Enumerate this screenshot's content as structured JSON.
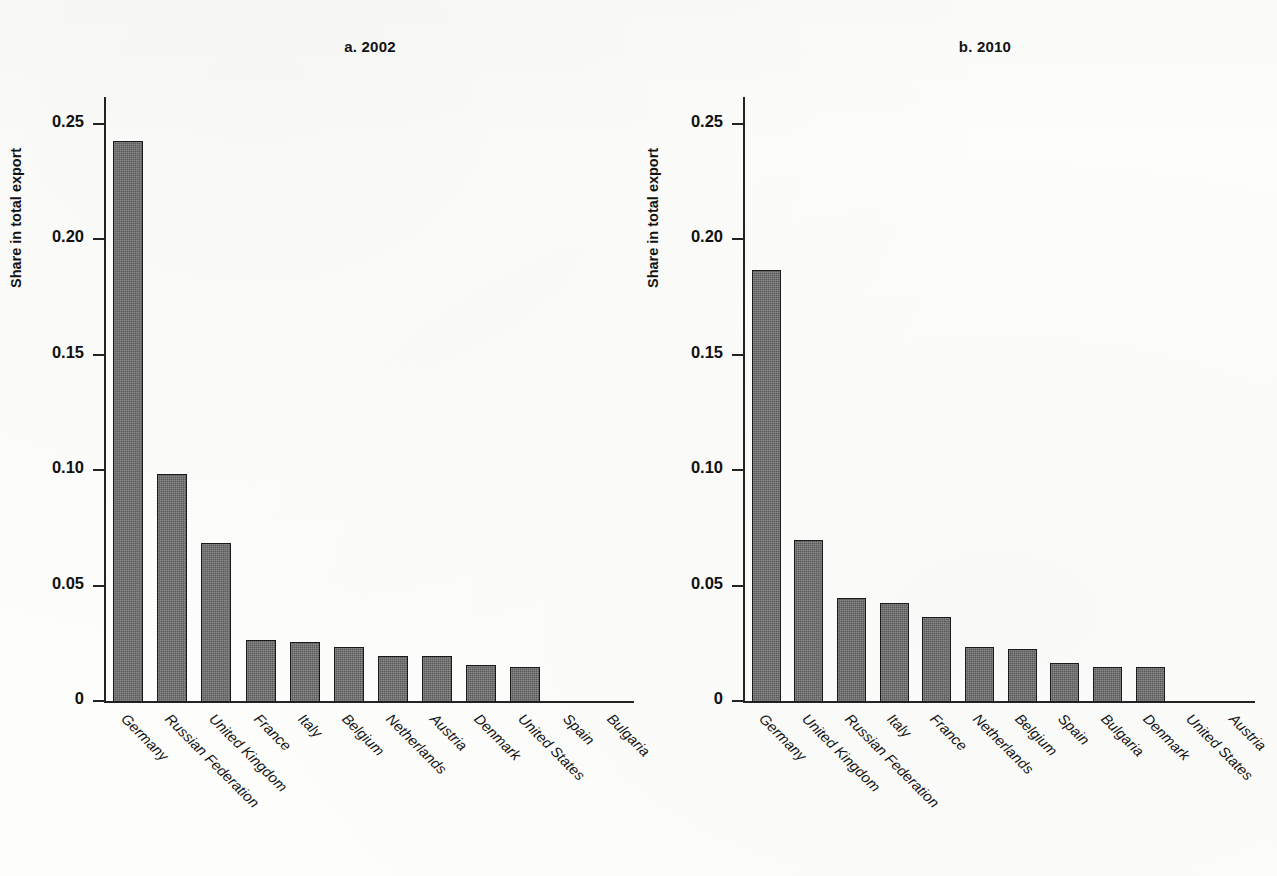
{
  "figure": {
    "ylabel": "Share in total export",
    "bar_color": "#5b5b5b",
    "bar_border_color": "#1a1a1a",
    "axis_color": "#232323"
  },
  "panels": [
    {
      "title": "a. 2002",
      "ylabel": "Share in total export"
    },
    {
      "title": "b. 2010",
      "ylabel": "Share in total export"
    }
  ],
  "axis": {
    "tick_labels": [
      "0.25",
      "0.20",
      "0.15",
      "0.10",
      "0.05",
      "0"
    ],
    "tick_values": [
      0.25,
      0.2,
      0.15,
      0.1,
      0.05,
      0
    ]
  },
  "chart_data": [
    {
      "type": "bar",
      "title": "a. 2002",
      "xlabel": "",
      "ylabel": "Share in total export",
      "ylim": [
        0,
        0.26
      ],
      "yticks": [
        0,
        0.05,
        0.1,
        0.15,
        0.2,
        0.25
      ],
      "ytick_labels": [
        "0",
        "0.05",
        "0.10",
        "0.15",
        "0.20",
        "0.25"
      ],
      "grid": false,
      "legend": "none",
      "categories": [
        "Germany",
        "Russian Federation",
        "United Kingdom",
        "France",
        "Italy",
        "Belgium",
        "Netherlands",
        "Austria",
        "Denmark",
        "United States",
        "Spain",
        "Bulgaria"
      ],
      "values": [
        0.243,
        0.099,
        0.069,
        0.027,
        0.026,
        0.024,
        0.02,
        0.02,
        0.016,
        0.015,
        0.0,
        0.0
      ]
    },
    {
      "type": "bar",
      "title": "b. 2010",
      "xlabel": "",
      "ylabel": "Share in total export",
      "ylim": [
        0,
        0.26
      ],
      "yticks": [
        0,
        0.05,
        0.1,
        0.15,
        0.2,
        0.25
      ],
      "ytick_labels": [
        "0",
        "0.05",
        "0.10",
        "0.15",
        "0.20",
        "0.25"
      ],
      "grid": false,
      "legend": "none",
      "categories": [
        "Germany",
        "United Kingdom",
        "Russian Federation",
        "Italy",
        "France",
        "Netherlands",
        "Belgium",
        "Spain",
        "Bulgaria",
        "Denmark",
        "United States",
        "Austria"
      ],
      "values": [
        0.187,
        0.07,
        0.045,
        0.043,
        0.037,
        0.024,
        0.023,
        0.017,
        0.015,
        0.015,
        0.0,
        0.0
      ]
    }
  ]
}
